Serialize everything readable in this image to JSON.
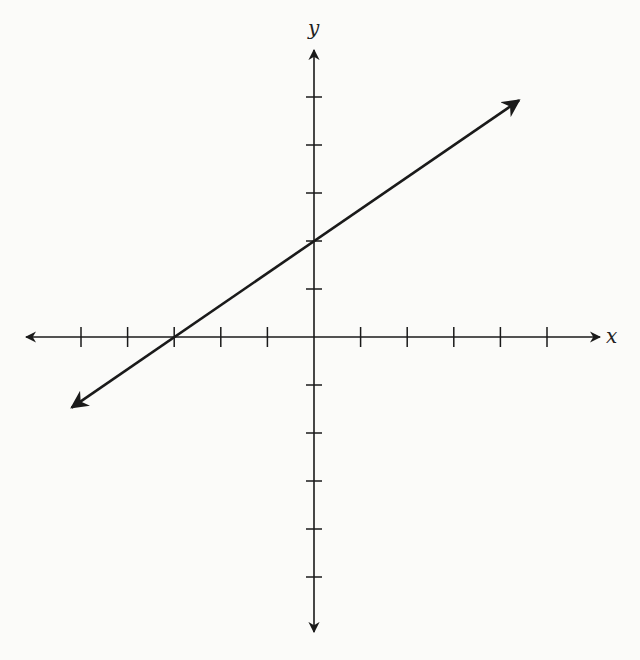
{
  "chart_data": {
    "type": "line",
    "title": "",
    "xlabel": "x",
    "ylabel": "y",
    "xlim": [
      -6,
      6
    ],
    "ylim": [
      -6,
      6
    ],
    "x_ticks": [
      -5,
      -4,
      -3,
      -2,
      -1,
      1,
      2,
      3,
      4,
      5
    ],
    "y_ticks": [
      -5,
      -4,
      -3,
      -2,
      -1,
      1,
      2,
      3,
      4,
      5
    ],
    "tick_labels_shown": false,
    "grid": false,
    "series": [
      {
        "name": "line",
        "equation": "y = (2/3)x + 2",
        "slope": 0.6667,
        "y_intercept": 2,
        "x_intercept": -3,
        "x": [
          -5.2,
          -3,
          0,
          4.4
        ],
        "y": [
          -1.47,
          0,
          2,
          4.93
        ]
      }
    ]
  },
  "axes": {
    "x_label": "x",
    "y_label": "y"
  }
}
